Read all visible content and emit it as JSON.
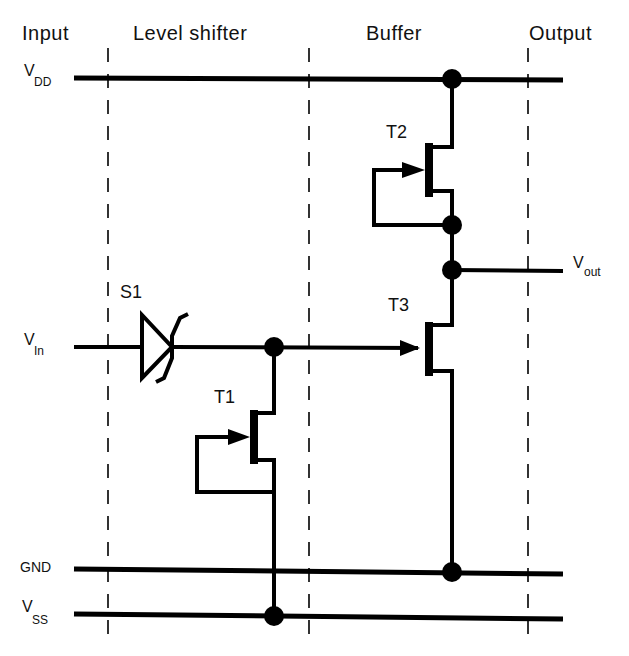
{
  "diagram": {
    "type": "circuit-schematic",
    "sections": [
      {
        "id": "input",
        "label": "Input"
      },
      {
        "id": "level-shifter",
        "label": "Level shifter"
      },
      {
        "id": "buffer",
        "label": "Buffer"
      },
      {
        "id": "output",
        "label": "Output"
      }
    ],
    "rails": {
      "vdd": {
        "main": "V",
        "sub": "DD"
      },
      "vin": {
        "main": "V",
        "sub": "In"
      },
      "vout": {
        "main": "V",
        "sub": "out"
      },
      "gnd": {
        "main": "GND"
      },
      "vss": {
        "main": "V",
        "sub": "SS"
      }
    },
    "components": {
      "s1": {
        "label": "S1",
        "kind": "schottky-diode"
      },
      "t1": {
        "label": "T1",
        "kind": "depletion-transistor"
      },
      "t2": {
        "label": "T2",
        "kind": "depletion-transistor"
      },
      "t3": {
        "label": "T3",
        "kind": "transistor"
      }
    },
    "colors": {
      "line": "#000000",
      "background": "#ffffff"
    }
  }
}
